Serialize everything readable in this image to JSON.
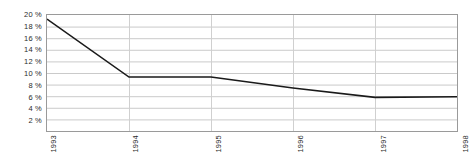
{
  "chart_data": {
    "type": "line",
    "title": "",
    "subtitle": "",
    "xlabel": "",
    "ylabel": "",
    "categories": [
      "1993",
      "1994",
      "1995",
      "1996",
      "1997",
      "1998"
    ],
    "x": [
      1993,
      1994,
      1995,
      1996,
      1997,
      1998
    ],
    "values": [
      19.3,
      9.3,
      9.3,
      7.4,
      5.8,
      5.9
    ],
    "series": [
      {
        "name": "",
        "values": [
          19.3,
          9.3,
          9.3,
          7.4,
          5.8,
          5.9
        ]
      }
    ],
    "ylim": [
      0,
      20
    ],
    "xlim": [
      1993,
      1998
    ],
    "y_ticks": [
      20,
      18,
      16,
      14,
      12,
      10,
      8,
      6,
      4,
      2
    ],
    "y_tick_labels": [
      "20 %",
      "18 %",
      "16 %",
      "14 %",
      "12 %",
      "10 %",
      "8 %",
      "6 %",
      "4 %",
      "2 %"
    ],
    "x_tick_labels": [
      "1993",
      "1994",
      "1995",
      "1996",
      "1997",
      "1998"
    ],
    "grid": true,
    "grid_horizontal": true,
    "grid_vertical": true,
    "legend": false,
    "legend_position": "none",
    "annotations": [],
    "unit": "%",
    "x_label_rotation": -90
  },
  "style": {
    "background_color": "#ffffff",
    "plot_background_color": "#ffffff",
    "line_color": "#1a1a1a",
    "grid_color": "#c9c9c9",
    "vertical_grid_color": "#cfcfcf",
    "border_color": "#9a9a9a",
    "tick_label_color": "#2b2b2b",
    "line_width": 1.6
  }
}
